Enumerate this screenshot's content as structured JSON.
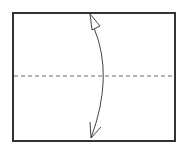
{
  "diagram": {
    "type": "origami-fold-step",
    "paper": {
      "x": 13,
      "y": 13,
      "width": 162,
      "height": 128,
      "stroke": "#333333",
      "stroke_width": 2,
      "fill": "#ffffff"
    },
    "fold_line": {
      "style": "dashed",
      "y": 76,
      "x1": 14,
      "x2": 174,
      "color": "#666666",
      "dash": "4 3"
    },
    "arrow": {
      "kind": "fold-and-unfold",
      "color": "#444444",
      "start": {
        "x": 91,
        "y": 138
      },
      "control": {
        "x": 114,
        "y": 76
      },
      "end": {
        "x": 94,
        "y": 28
      },
      "head_top": "hollow-triangle",
      "head_bottom": "open-v"
    }
  }
}
